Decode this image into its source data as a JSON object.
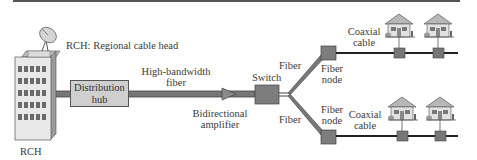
{
  "diagram": {
    "title_legend": "RCH: Regional cable head",
    "nodes": {
      "rch": {
        "label": "RCH"
      },
      "hub": {
        "label_line1": "Distribution",
        "label_line2": "hub"
      },
      "amplifier": {
        "label_line1": "Bidirectional",
        "label_line2": "amplifier"
      },
      "switch": {
        "label": "Switch"
      },
      "fiber_node_upper": {
        "label_line1": "Fiber",
        "label_line2": "node"
      },
      "fiber_node_lower": {
        "label_line1": "Fiber",
        "label_line2": "node"
      }
    },
    "links": {
      "trunk": {
        "label_line1": "High-bandwidth",
        "label_line2": "fiber"
      },
      "fiber_upper": {
        "label": "Fiber"
      },
      "fiber_lower": {
        "label": "Fiber"
      },
      "coax_upper": {
        "label_line1": "Coaxial",
        "label_line2": "cable"
      },
      "coax_lower": {
        "label_line1": "Coaxial",
        "label_line2": "cable"
      }
    },
    "houses_per_branch": 2,
    "colors": {
      "line": "#555555",
      "box_fill": "#cfcfcf",
      "tap_fill": "#777777",
      "building_fill": "#e6e6e6",
      "window": "#666666"
    }
  }
}
